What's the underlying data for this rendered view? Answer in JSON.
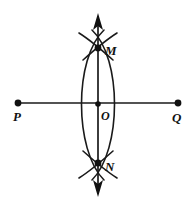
{
  "figure": {
    "type": "geometry-construction",
    "background_color": "#ffffff",
    "stroke_color": "#1a1a1a",
    "labels": {
      "p": "P",
      "q": "Q",
      "m": "M",
      "n": "N",
      "o": "O"
    },
    "points": [
      {
        "name": "P",
        "label": "P",
        "x": 18,
        "y": 103,
        "label_x": 16,
        "label_y": 120,
        "marker": "filled-dot"
      },
      {
        "name": "Q",
        "label": "Q",
        "x": 178,
        "y": 103,
        "label_x": 174,
        "label_y": 121,
        "marker": "filled-dot"
      },
      {
        "name": "M",
        "label": "M",
        "x": 98,
        "y": 48,
        "label_x": 106,
        "label_y": 54,
        "marker": "filled-dot"
      },
      {
        "name": "N",
        "label": "N",
        "x": 98,
        "y": 163,
        "label_x": 106,
        "label_y": 170,
        "marker": "filled-dot"
      },
      {
        "name": "O",
        "label": "O",
        "x": 98,
        "y": 104,
        "label_x": 102,
        "label_y": 118,
        "marker": "filled-dot"
      }
    ],
    "lines": [
      {
        "name": "line-pq",
        "description": "Horizontal segment P to Q",
        "x1": 18,
        "y1": 103,
        "x2": 178,
        "y2": 103,
        "width": 1.7,
        "arrows": "none"
      },
      {
        "name": "line-mn",
        "description": "Vertical double-headed arrow line through M, O, N",
        "x1": 98,
        "y1": 14,
        "x2": 98,
        "y2": 196,
        "width": 1.7,
        "arrows": "both"
      }
    ],
    "arcs": [
      {
        "name": "arc-left-major",
        "description": "Compass arc centered near P intersecting at M and N",
        "path": "M 104 30 C 74 58, 74 150, 104 180"
      },
      {
        "name": "arc-right-major",
        "description": "Compass arc centered near Q intersecting at M and N",
        "path": "M 92 30 C 122 58, 122 150, 92 180"
      },
      {
        "name": "arc-top-left-tick",
        "description": "Upper-left short arc crossing through M",
        "path": "M 79 33 C 87 38, 95 44, 113 60"
      },
      {
        "name": "arc-top-right-tick",
        "description": "Upper-right short arc crossing through M",
        "path": "M 117 33 C 109 38, 101 44, 83 60"
      },
      {
        "name": "arc-bottom-left-tick",
        "description": "Lower-left short arc crossing through N",
        "path": "M 79 178 C 87 173, 95 167, 113 151"
      },
      {
        "name": "arc-bottom-right-tick",
        "description": "Lower-right short arc crossing through N",
        "path": "M 117 178 C 109 173, 101 167, 83 151"
      }
    ],
    "arrowheads": [
      {
        "name": "arrow-top",
        "direction": "up",
        "tip_x": 98,
        "tip_y": 13,
        "half_width": 5,
        "length": 16
      },
      {
        "name": "arrow-bottom",
        "direction": "down",
        "tip_x": 98,
        "tip_y": 197,
        "half_width": 5,
        "length": 16
      }
    ],
    "dot_radius": 3.2
  }
}
